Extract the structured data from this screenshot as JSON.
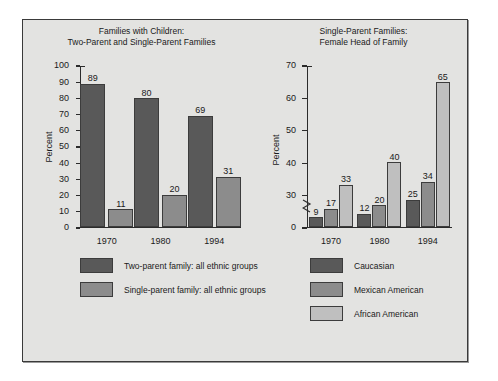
{
  "figure": {
    "background_color": "#e3e3e1",
    "border_color": "#3a3a3a"
  },
  "palette": {
    "dark": "#595959",
    "medium": "#8c8c8c",
    "light": "#bfbfbf"
  },
  "chart_data": [
    {
      "type": "bar",
      "title": "Families with Children:\nTwo-Parent and Single-Parent Families",
      "xlabel": "",
      "ylabel": "Percent",
      "ylim": [
        0,
        100
      ],
      "yticks": [
        0,
        10,
        20,
        30,
        40,
        50,
        60,
        70,
        80,
        90,
        100
      ],
      "ytick_labels": [
        "0",
        "10",
        "20",
        "30",
        "40",
        "50",
        "60",
        "70",
        "80",
        "90",
        "100"
      ],
      "categories": [
        "1970",
        "1980",
        "1994"
      ],
      "grid": false,
      "axis_break": false,
      "legend_position": "below",
      "series": [
        {
          "name": "Two-parent family: all ethnic groups",
          "color": "#595959",
          "values": [
            89,
            80,
            69
          ]
        },
        {
          "name": "Single-parent family: all ethnic groups",
          "color": "#8c8c8c",
          "values": [
            11,
            20,
            31
          ]
        }
      ]
    },
    {
      "type": "bar",
      "title": "Single-Parent Families:\nFemale Head of Family",
      "xlabel": "",
      "ylabel": "Percent",
      "ylim": [
        0,
        70
      ],
      "yticks": [
        0,
        30,
        40,
        50,
        60,
        70
      ],
      "ytick_labels": [
        "0",
        "30",
        "40",
        "50",
        "60",
        "70"
      ],
      "categories": [
        "1970",
        "1980",
        "1994"
      ],
      "grid": false,
      "axis_break": true,
      "axis_break_between": [
        0,
        30
      ],
      "legend_position": "below",
      "series": [
        {
          "name": "Caucasian",
          "color": "#595959",
          "values": [
            9,
            12,
            25
          ]
        },
        {
          "name": "Mexican American",
          "color": "#8c8c8c",
          "values": [
            17,
            20,
            34
          ]
        },
        {
          "name": "African American",
          "color": "#bfbfbf",
          "values": [
            33,
            40,
            65
          ]
        }
      ]
    }
  ]
}
